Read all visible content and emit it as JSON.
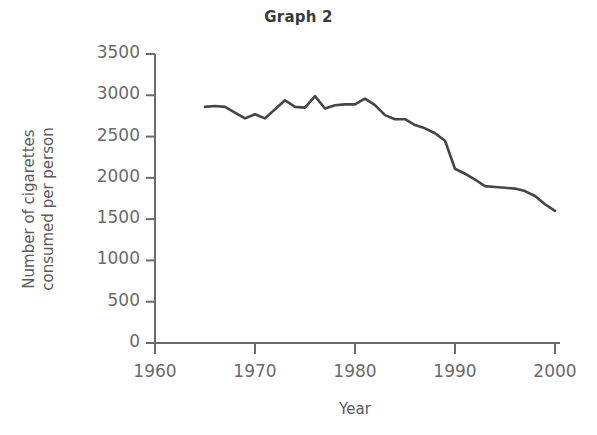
{
  "chart_data": {
    "type": "line",
    "title": "Graph 2",
    "xlabel": "Year",
    "ylabel": "Number of cigarettes\nconsumed per person",
    "xlim": [
      1960,
      2000
    ],
    "ylim": [
      0,
      3500
    ],
    "grid": false,
    "legend": "none",
    "line_color": "#454545",
    "axis_color": "#6a6a6a",
    "xticks": [
      "1960",
      "1970",
      "1980",
      "1990",
      "2000"
    ],
    "xtick_values": [
      1960,
      1970,
      1980,
      1990,
      2000
    ],
    "yticks": [
      "0",
      "500",
      "1000",
      "1500",
      "2000",
      "2500",
      "3000",
      "3500"
    ],
    "ytick_values": [
      0,
      500,
      1000,
      1500,
      2000,
      2500,
      3000,
      3500
    ],
    "series": [
      {
        "name": "Cigarettes consumed per person",
        "x": [
          1965,
          1966,
          1967,
          1968,
          1969,
          1970,
          1971,
          1972,
          1973,
          1974,
          1975,
          1976,
          1977,
          1978,
          1979,
          1980,
          1981,
          1982,
          1983,
          1984,
          1985,
          1986,
          1987,
          1988,
          1989,
          1990,
          1991,
          1992,
          1993,
          1994,
          1995,
          1996,
          1997,
          1998,
          1999,
          2000
        ],
        "values": [
          2860,
          2870,
          2860,
          2790,
          2720,
          2770,
          2720,
          2830,
          2940,
          2860,
          2850,
          2990,
          2840,
          2880,
          2890,
          2890,
          2960,
          2880,
          2760,
          2710,
          2710,
          2640,
          2600,
          2540,
          2450,
          2110,
          2050,
          1980,
          1900,
          1890,
          1880,
          1870,
          1840,
          1780,
          1680,
          1600
        ]
      }
    ]
  }
}
